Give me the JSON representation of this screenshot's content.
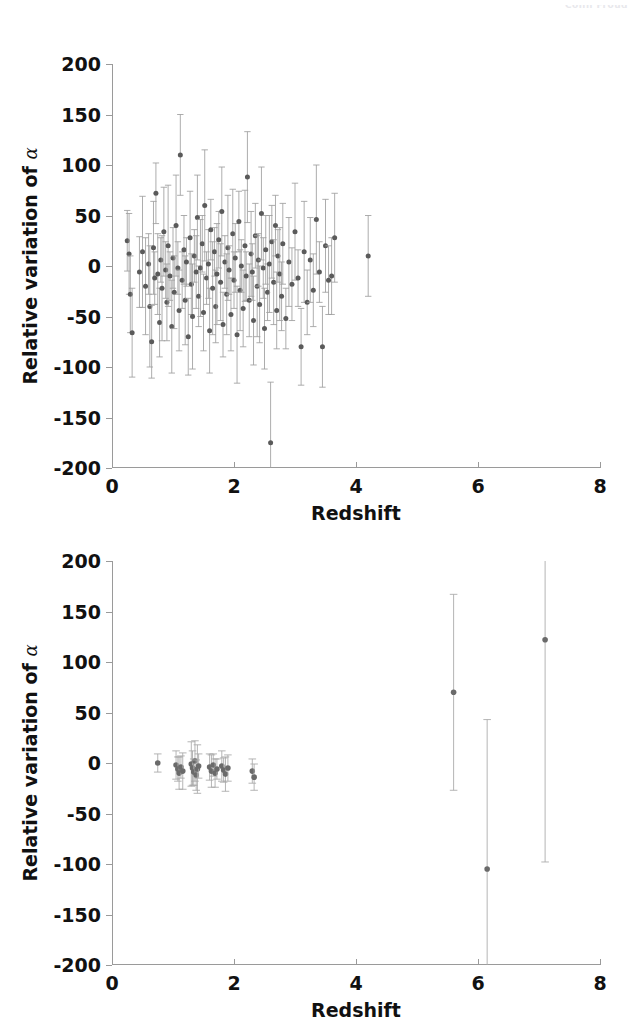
{
  "page": {
    "header_fragment": "Colin Froud"
  },
  "chart_data": [
    {
      "id": "top",
      "type": "scatter",
      "title": "",
      "xlabel": "Redshift",
      "ylabel": "Relative variation of α",
      "xlim": [
        0,
        8
      ],
      "ylim": [
        -200,
        200
      ],
      "xticks": [
        0,
        2,
        4,
        6,
        8
      ],
      "yticks": [
        200,
        150,
        100,
        50,
        0,
        -50,
        -100,
        -150,
        -200
      ],
      "xticklabels": [
        "0",
        "2",
        "4",
        "6",
        "8"
      ],
      "yticklabels": [
        "200",
        "150",
        "100",
        "50",
        "0",
        "-50",
        "-100",
        "-150",
        "-200"
      ],
      "grid": false,
      "legend": null,
      "marker_color": "#5a5a5a",
      "errorbar_color": "#9e9e9e",
      "series_name": "Keck/VLT absorber sample",
      "points": [
        {
          "x": 0.25,
          "y": 25,
          "e": 30
        },
        {
          "x": 0.28,
          "y": 12,
          "e": 40
        },
        {
          "x": 0.3,
          "y": -28,
          "e": 38
        },
        {
          "x": 0.33,
          "y": -66,
          "e": 44
        },
        {
          "x": 0.45,
          "y": -6,
          "e": 35
        },
        {
          "x": 0.5,
          "y": 14,
          "e": 55
        },
        {
          "x": 0.55,
          "y": -20,
          "e": 48
        },
        {
          "x": 0.6,
          "y": 2,
          "e": 30
        },
        {
          "x": 0.62,
          "y": -40,
          "e": 60
        },
        {
          "x": 0.65,
          "y": -75,
          "e": 36
        },
        {
          "x": 0.68,
          "y": 18,
          "e": 46
        },
        {
          "x": 0.7,
          "y": -12,
          "e": 26
        },
        {
          "x": 0.72,
          "y": 72,
          "e": 30
        },
        {
          "x": 0.75,
          "y": -8,
          "e": 40
        },
        {
          "x": 0.78,
          "y": -56,
          "e": 34
        },
        {
          "x": 0.8,
          "y": 6,
          "e": 22
        },
        {
          "x": 0.82,
          "y": -22,
          "e": 52
        },
        {
          "x": 0.85,
          "y": 34,
          "e": 44
        },
        {
          "x": 0.88,
          "y": -4,
          "e": 28
        },
        {
          "x": 0.9,
          "y": -36,
          "e": 38
        },
        {
          "x": 0.92,
          "y": 20,
          "e": 60
        },
        {
          "x": 0.95,
          "y": -10,
          "e": 24
        },
        {
          "x": 0.98,
          "y": -60,
          "e": 46
        },
        {
          "x": 1.0,
          "y": 8,
          "e": 30
        },
        {
          "x": 1.02,
          "y": -26,
          "e": 36
        },
        {
          "x": 1.05,
          "y": 40,
          "e": 50
        },
        {
          "x": 1.08,
          "y": -2,
          "e": 26
        },
        {
          "x": 1.1,
          "y": -44,
          "e": 40
        },
        {
          "x": 1.12,
          "y": 110,
          "e": 40
        },
        {
          "x": 1.15,
          "y": -14,
          "e": 28
        },
        {
          "x": 1.18,
          "y": 16,
          "e": 34
        },
        {
          "x": 1.2,
          "y": -34,
          "e": 44
        },
        {
          "x": 1.22,
          "y": 4,
          "e": 24
        },
        {
          "x": 1.25,
          "y": -70,
          "e": 38
        },
        {
          "x": 1.28,
          "y": 28,
          "e": 46
        },
        {
          "x": 1.3,
          "y": -18,
          "e": 30
        },
        {
          "x": 1.32,
          "y": -50,
          "e": 52
        },
        {
          "x": 1.35,
          "y": 10,
          "e": 26
        },
        {
          "x": 1.38,
          "y": -6,
          "e": 36
        },
        {
          "x": 1.4,
          "y": 48,
          "e": 42
        },
        {
          "x": 1.42,
          "y": -30,
          "e": 30
        },
        {
          "x": 1.45,
          "y": -2,
          "e": 48
        },
        {
          "x": 1.48,
          "y": 22,
          "e": 28
        },
        {
          "x": 1.5,
          "y": -46,
          "e": 38
        },
        {
          "x": 1.52,
          "y": 60,
          "e": 55
        },
        {
          "x": 1.55,
          "y": -12,
          "e": 26
        },
        {
          "x": 1.58,
          "y": 2,
          "e": 34
        },
        {
          "x": 1.6,
          "y": -64,
          "e": 42
        },
        {
          "x": 1.62,
          "y": 36,
          "e": 30
        },
        {
          "x": 1.65,
          "y": -22,
          "e": 46
        },
        {
          "x": 1.68,
          "y": 14,
          "e": 24
        },
        {
          "x": 1.7,
          "y": -40,
          "e": 36
        },
        {
          "x": 1.72,
          "y": -8,
          "e": 50
        },
        {
          "x": 1.75,
          "y": 26,
          "e": 28
        },
        {
          "x": 1.78,
          "y": -16,
          "e": 38
        },
        {
          "x": 1.8,
          "y": 54,
          "e": 44
        },
        {
          "x": 1.82,
          "y": -58,
          "e": 32
        },
        {
          "x": 1.85,
          "y": 4,
          "e": 26
        },
        {
          "x": 1.88,
          "y": -28,
          "e": 40
        },
        {
          "x": 1.9,
          "y": 18,
          "e": 52
        },
        {
          "x": 1.92,
          "y": -4,
          "e": 24
        },
        {
          "x": 1.95,
          "y": -48,
          "e": 36
        },
        {
          "x": 1.98,
          "y": 32,
          "e": 44
        },
        {
          "x": 2.0,
          "y": -14,
          "e": 28
        },
        {
          "x": 2.02,
          "y": 8,
          "e": 34
        },
        {
          "x": 2.05,
          "y": -68,
          "e": 48
        },
        {
          "x": 2.08,
          "y": 44,
          "e": 30
        },
        {
          "x": 2.1,
          "y": -24,
          "e": 40
        },
        {
          "x": 2.12,
          "y": 0,
          "e": 26
        },
        {
          "x": 2.15,
          "y": -42,
          "e": 38
        },
        {
          "x": 2.18,
          "y": 20,
          "e": 55
        },
        {
          "x": 2.2,
          "y": -10,
          "e": 24
        },
        {
          "x": 2.22,
          "y": 88,
          "e": 45
        },
        {
          "x": 2.25,
          "y": -34,
          "e": 36
        },
        {
          "x": 2.28,
          "y": 12,
          "e": 42
        },
        {
          "x": 2.3,
          "y": -6,
          "e": 28
        },
        {
          "x": 2.32,
          "y": -54,
          "e": 44
        },
        {
          "x": 2.35,
          "y": 30,
          "e": 32
        },
        {
          "x": 2.38,
          "y": -20,
          "e": 50
        },
        {
          "x": 2.4,
          "y": 6,
          "e": 26
        },
        {
          "x": 2.42,
          "y": -38,
          "e": 38
        },
        {
          "x": 2.45,
          "y": 52,
          "e": 46
        },
        {
          "x": 2.48,
          "y": -2,
          "e": 30
        },
        {
          "x": 2.5,
          "y": -62,
          "e": 40
        },
        {
          "x": 2.52,
          "y": 16,
          "e": 34
        },
        {
          "x": 2.55,
          "y": -26,
          "e": 28
        },
        {
          "x": 2.58,
          "y": 2,
          "e": 48
        },
        {
          "x": 2.6,
          "y": -175,
          "e": 60
        },
        {
          "x": 2.62,
          "y": 24,
          "e": 36
        },
        {
          "x": 2.65,
          "y": -16,
          "e": 42
        },
        {
          "x": 2.68,
          "y": 40,
          "e": 30
        },
        {
          "x": 2.7,
          "y": -44,
          "e": 38
        },
        {
          "x": 2.72,
          "y": 10,
          "e": 26
        },
        {
          "x": 2.75,
          "y": -8,
          "e": 46
        },
        {
          "x": 2.78,
          "y": -30,
          "e": 34
        },
        {
          "x": 2.8,
          "y": 22,
          "e": 40
        },
        {
          "x": 2.85,
          "y": -52,
          "e": 30
        },
        {
          "x": 2.9,
          "y": 4,
          "e": 44
        },
        {
          "x": 2.95,
          "y": -18,
          "e": 36
        },
        {
          "x": 3.0,
          "y": 34,
          "e": 48
        },
        {
          "x": 3.05,
          "y": -12,
          "e": 28
        },
        {
          "x": 3.1,
          "y": -80,
          "e": 38
        },
        {
          "x": 3.15,
          "y": 14,
          "e": 50
        },
        {
          "x": 3.2,
          "y": -36,
          "e": 32
        },
        {
          "x": 3.25,
          "y": 6,
          "e": 42
        },
        {
          "x": 3.3,
          "y": -24,
          "e": 36
        },
        {
          "x": 3.35,
          "y": 46,
          "e": 54
        },
        {
          "x": 3.4,
          "y": -6,
          "e": 30
        },
        {
          "x": 3.45,
          "y": -80,
          "e": 40
        },
        {
          "x": 3.5,
          "y": 20,
          "e": 46
        },
        {
          "x": 3.55,
          "y": -14,
          "e": 34
        },
        {
          "x": 3.6,
          "y": -10,
          "e": 38
        },
        {
          "x": 3.65,
          "y": 28,
          "e": 44
        },
        {
          "x": 4.2,
          "y": 10,
          "e": 40
        }
      ]
    },
    {
      "id": "bottom",
      "type": "scatter",
      "title": "",
      "xlabel": "Redshift",
      "ylabel": "Relative variation of α",
      "xlim": [
        0,
        8
      ],
      "ylim": [
        -200,
        200
      ],
      "xticks": [
        0,
        2,
        4,
        6,
        8
      ],
      "yticks": [
        200,
        150,
        100,
        50,
        0,
        -50,
        -100,
        -150,
        -200
      ],
      "xticklabels": [
        "0",
        "2",
        "4",
        "6",
        "8"
      ],
      "yticklabels": [
        "200",
        "150",
        "100",
        "50",
        "0",
        "-50",
        "-100",
        "-150",
        "-200"
      ],
      "grid": false,
      "legend": null,
      "marker_color": "#6a6a6a",
      "errorbar_color": "#a8a8a8",
      "series_name": "High-redshift quasar sample",
      "points": [
        {
          "x": 0.75,
          "y": 0,
          "e": 9
        },
        {
          "x": 1.05,
          "y": -2,
          "e": 14
        },
        {
          "x": 1.08,
          "y": -6,
          "e": 12
        },
        {
          "x": 1.1,
          "y": -10,
          "e": 16
        },
        {
          "x": 1.13,
          "y": -4,
          "e": 11
        },
        {
          "x": 1.16,
          "y": -8,
          "e": 18
        },
        {
          "x": 1.3,
          "y": -1,
          "e": 22
        },
        {
          "x": 1.32,
          "y": -5,
          "e": 17
        },
        {
          "x": 1.34,
          "y": -9,
          "e": 13
        },
        {
          "x": 1.36,
          "y": 2,
          "e": 20
        },
        {
          "x": 1.38,
          "y": -12,
          "e": 15
        },
        {
          "x": 1.4,
          "y": -6,
          "e": 24
        },
        {
          "x": 1.42,
          "y": -3,
          "e": 12
        },
        {
          "x": 1.6,
          "y": -4,
          "e": 13
        },
        {
          "x": 1.63,
          "y": -8,
          "e": 16
        },
        {
          "x": 1.66,
          "y": -2,
          "e": 11
        },
        {
          "x": 1.69,
          "y": -10,
          "e": 14
        },
        {
          "x": 1.72,
          "y": -6,
          "e": 10
        },
        {
          "x": 1.8,
          "y": -3,
          "e": 15
        },
        {
          "x": 1.83,
          "y": -7,
          "e": 12
        },
        {
          "x": 1.86,
          "y": -11,
          "e": 17
        },
        {
          "x": 1.9,
          "y": -5,
          "e": 13
        },
        {
          "x": 2.3,
          "y": -8,
          "e": 12
        },
        {
          "x": 2.33,
          "y": -14,
          "e": 13
        },
        {
          "x": 5.6,
          "y": 70,
          "e": 97
        },
        {
          "x": 6.15,
          "y": -105,
          "e": 148
        },
        {
          "x": 7.1,
          "y": 122,
          "e": 220
        }
      ]
    }
  ]
}
